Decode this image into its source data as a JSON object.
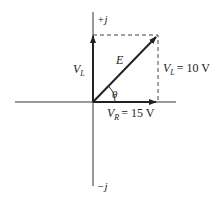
{
  "diagram": {
    "type": "phasor-diagram",
    "axes": {
      "positive_imag_label": "+j",
      "negative_imag_label": "−j"
    },
    "phasors": [
      {
        "name": "V_L",
        "label_main": "V",
        "label_sub": "L",
        "direction": "up"
      },
      {
        "name": "V_R",
        "label_main": "V",
        "label_sub": "R",
        "value_text": "= 15 V",
        "direction": "right"
      },
      {
        "name": "E",
        "label_main": "E",
        "direction": "diagonal"
      }
    ],
    "projection_label": {
      "main": "V",
      "sub": "L",
      "value_text": "= 10 V"
    },
    "angle_label": "θ",
    "colors": {
      "line": "#222222",
      "dashed": "#444444"
    }
  }
}
